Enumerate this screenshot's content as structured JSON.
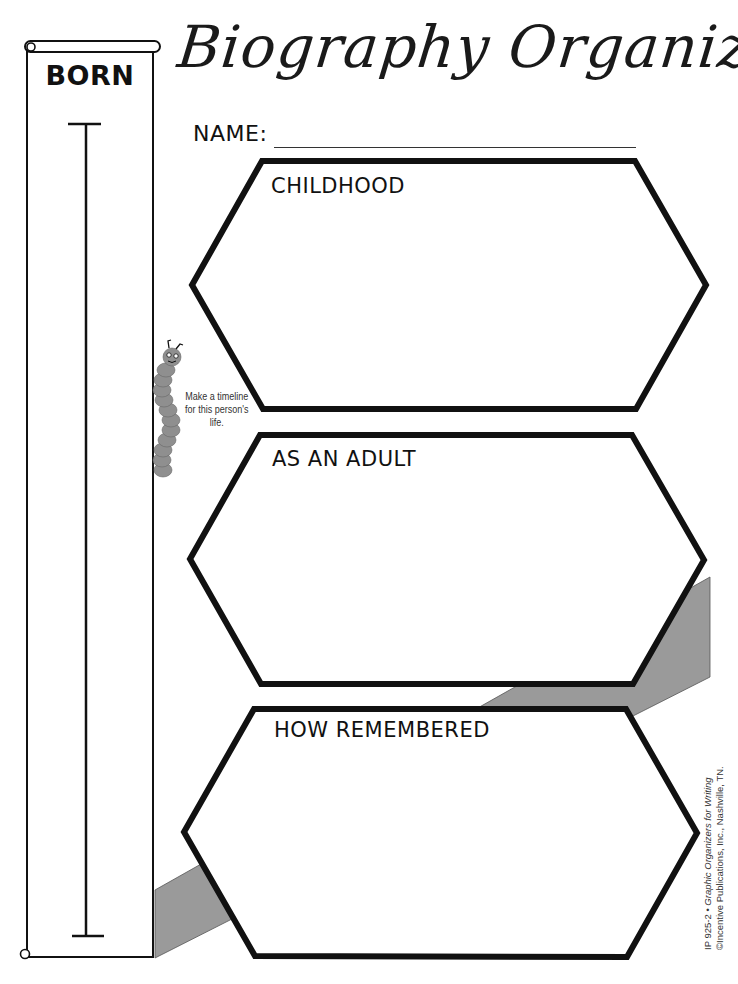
{
  "page": {
    "title": "Biography Organizer",
    "name_label": "NAME:",
    "name_value": ""
  },
  "timeline": {
    "label": "BORN",
    "hint": "Make a timeline for this person's life.",
    "hint_icon": "caterpillar-icon"
  },
  "sections": [
    {
      "label": "CHILDHOOD",
      "value": ""
    },
    {
      "label": "AS AN ADULT",
      "value": ""
    },
    {
      "label": "HOW REMEMBERED",
      "value": ""
    }
  ],
  "footer": {
    "credit_line1": "IP 925-2 • ",
    "credit_title": "Graphic Organizers for Writing",
    "credit_line2": "©Incentive Publications, Inc., Nashville, TN."
  },
  "colors": {
    "ink": "#111111",
    "band_gray": "#9a9a9a",
    "caterpillar_gray": "#8f8f8f"
  }
}
